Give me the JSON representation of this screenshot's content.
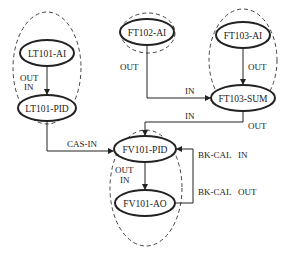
{
  "nodes": {
    "lt101_ai": "LT101-AI",
    "lt101_pid": "LT101-PID",
    "ft102_ai": "FT102-AI",
    "ft103_ai": "FT103-AI",
    "ft103_sum": "FT103-SUM",
    "fv101_pid": "FV101-PID",
    "fv101_ao": "FV101-AO"
  },
  "labels": {
    "lt_out": "OUT",
    "lt_in": "IN",
    "ft102_out": "OUT",
    "ft102_in": "IN",
    "ft103_out": "OUT",
    "sum_in": "IN",
    "sum_out": "OUT",
    "cas_in": "CAS-IN",
    "fv_out": "OUT",
    "fv_in": "IN",
    "bkcal_in": "BK-CAL   IN",
    "bkcal_out": "BK-CAL   OUT"
  },
  "colors": {
    "stroke": "#222222",
    "dashed": "#444444"
  }
}
